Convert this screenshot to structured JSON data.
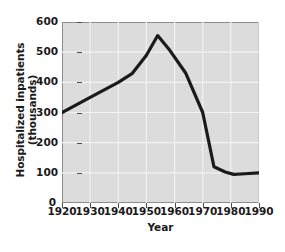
{
  "chart_data": {
    "type": "line",
    "title": "",
    "xlabel": "Year",
    "ylabel": "Hospitalized inpatients (thousands)",
    "xlim": [
      1920,
      1990
    ],
    "ylim": [
      0,
      600
    ],
    "xticks": [
      1920,
      1930,
      1940,
      1950,
      1960,
      1970,
      1980,
      1990
    ],
    "yticks": [
      0,
      100,
      200,
      300,
      400,
      500,
      600
    ],
    "grid": true,
    "legend": "none",
    "series": [
      {
        "name": "Hospitalized inpatients",
        "color": "#1a1a1a",
        "x": [
          1920,
          1930,
          1940,
          1945,
          1950,
          1954,
          1958,
          1964,
          1970,
          1974,
          1978,
          1981,
          1985,
          1990
        ],
        "values": [
          300,
          350,
          400,
          430,
          490,
          555,
          510,
          430,
          300,
          120,
          103,
          95,
          97,
          100
        ]
      }
    ]
  },
  "axes": {
    "x_tick_labels": [
      "1920",
      "1930",
      "1940",
      "1950",
      "1960",
      "1970",
      "1980",
      "1990"
    ],
    "y_tick_labels": [
      "0",
      "100",
      "200",
      "300",
      "400",
      "500",
      "600"
    ],
    "x_axis_title": "Year",
    "y_axis_title": "Hospitalized inpatients (thousands)",
    "zero_label": "0"
  },
  "style": {
    "panel_color": "#dcdcdc",
    "grid_color": "#f2f2f2",
    "line_color": "#1a1a1a",
    "axis_color": "#4d4d4d",
    "text_color": "#1a1a1a",
    "background": "#ffffff"
  }
}
